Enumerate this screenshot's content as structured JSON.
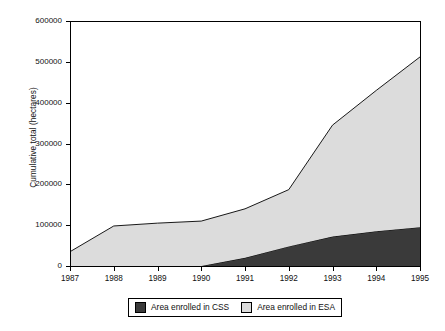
{
  "chart_data": {
    "type": "area",
    "stacked": true,
    "title": "",
    "xlabel": "",
    "ylabel": "Cumulative total (hectares)",
    "categories": [
      "1987",
      "1988",
      "1989",
      "1990",
      "1991",
      "1992",
      "1993",
      "1994",
      "1995"
    ],
    "x": [
      1987,
      1988,
      1989,
      1990,
      1991,
      1992,
      1993,
      1994,
      1995
    ],
    "xlim": [
      1987,
      1995
    ],
    "ylim": [
      0,
      600000
    ],
    "yticks": [
      0,
      100000,
      200000,
      300000,
      400000,
      500000,
      600000
    ],
    "ytick_labels": [
      "0",
      "100000",
      "200000",
      "300000",
      "400000",
      "500000",
      "600000"
    ],
    "xtick_labels": [
      "1987",
      "1988",
      "1989",
      "1990",
      "1991",
      "1992",
      "1993",
      "1994",
      "1995"
    ],
    "grid": false,
    "legend_position": "bottom",
    "series": [
      {
        "name": "Area enrolled in CSS",
        "color": "#3a3a3a",
        "values": [
          0,
          0,
          0,
          0,
          20000,
          48000,
          72000,
          85000,
          95000
        ]
      },
      {
        "name": "Area enrolled in ESA",
        "color": "#dcdcdc",
        "values": [
          35000,
          98000,
          105000,
          110000,
          120000,
          139000,
          273000,
          345000,
          417000
        ]
      }
    ],
    "cumulative_totals": [
      35000,
      98000,
      105000,
      110000,
      140000,
      187000,
      345000,
      430000,
      512000
    ]
  },
  "axes": {
    "y_title": "Cumulative total (hectares)"
  },
  "legend": {
    "items": [
      {
        "label": "Area enrolled in CSS",
        "color": "#3a3a3a"
      },
      {
        "label": "Area enrolled in ESA",
        "color": "#dcdcdc"
      }
    ]
  }
}
